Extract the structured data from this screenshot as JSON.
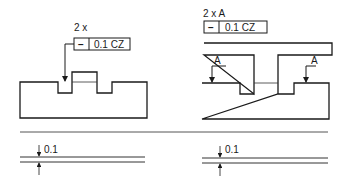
{
  "colors": {
    "line": "#1a1a1a",
    "thin": "#555555",
    "background": "#ffffff"
  },
  "left_figure": {
    "count_label": "2 x",
    "frame": {
      "symbol": "−",
      "symbol_name": "straightness-icon",
      "tolerance": "0.1 CZ"
    }
  },
  "right_figure": {
    "count_label": "2 x A",
    "frame": {
      "symbol": "−",
      "symbol_name": "straightness-icon",
      "tolerance": "0.1 CZ"
    },
    "datum_labels": [
      "A",
      "A"
    ]
  },
  "zones": {
    "left": {
      "value": "0.1"
    },
    "right": {
      "value": "0.1"
    }
  }
}
